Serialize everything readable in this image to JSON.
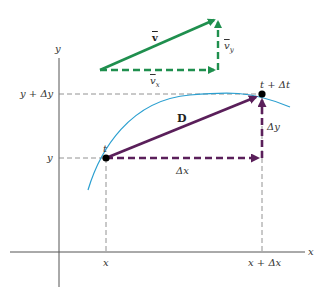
{
  "figure": {
    "colors": {
      "velocity": "#1f8f4e",
      "displacement": "#5a1f5a",
      "curve": "#2a9fd0",
      "axes": "#555555",
      "guides": "#777777"
    },
    "axes": {
      "x_label": "x",
      "y_label": "y"
    },
    "ticks": {
      "x": "x",
      "x_plus": "x + Δx",
      "y": "y",
      "y_plus": "y + Δy"
    },
    "points": {
      "start": "t",
      "end": "t + Δt"
    },
    "vectors": {
      "displacement": "D",
      "dx": "Δx",
      "dy": "Δy",
      "velocity": "v",
      "vx": "v",
      "vx_sub": "x",
      "vy": "v",
      "vy_sub": "y"
    }
  }
}
